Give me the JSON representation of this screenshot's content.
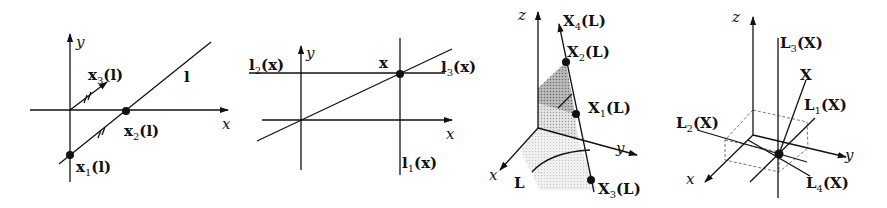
{
  "figure": {
    "panels": [
      {
        "id": "panel-1-2d-line",
        "axes": {
          "x_label": "x",
          "y_label": "y"
        },
        "line_label": "l",
        "points": [
          {
            "base": "x",
            "sub": "1",
            "arg": "(l)"
          },
          {
            "base": "x",
            "sub": "2",
            "arg": "(l)"
          },
          {
            "base": "x",
            "sub": "3",
            "arg": "(l)"
          }
        ]
      },
      {
        "id": "panel-2-2d-point",
        "axes": {
          "x_label": "x",
          "y_label": "y"
        },
        "point_label": "x",
        "lines": [
          {
            "base": "l",
            "sub": "1",
            "arg": "(x)"
          },
          {
            "base": "l",
            "sub": "2",
            "arg": "(x)"
          },
          {
            "base": "l",
            "sub": "3",
            "arg": "(x)"
          }
        ]
      },
      {
        "id": "panel-3-3d-line",
        "axes": {
          "x_label": "x",
          "y_label": "y",
          "z_label": "z"
        },
        "line_label": "L",
        "points": [
          {
            "base": "X",
            "sub": "1",
            "arg": "(L)"
          },
          {
            "base": "X",
            "sub": "2",
            "arg": "(L)"
          },
          {
            "base": "X",
            "sub": "3",
            "arg": "(L)"
          },
          {
            "base": "X",
            "sub": "4",
            "arg": "(L)"
          }
        ]
      },
      {
        "id": "panel-4-3d-point",
        "axes": {
          "x_label": "x",
          "y_label": "y",
          "z_label": "z"
        },
        "point_label": "X",
        "lines": [
          {
            "base": "L",
            "sub": "1",
            "arg": "(X)"
          },
          {
            "base": "L",
            "sub": "2",
            "arg": "(X)"
          },
          {
            "base": "L",
            "sub": "3",
            "arg": "(X)"
          },
          {
            "base": "L",
            "sub": "4",
            "arg": "(X)"
          }
        ]
      }
    ]
  }
}
